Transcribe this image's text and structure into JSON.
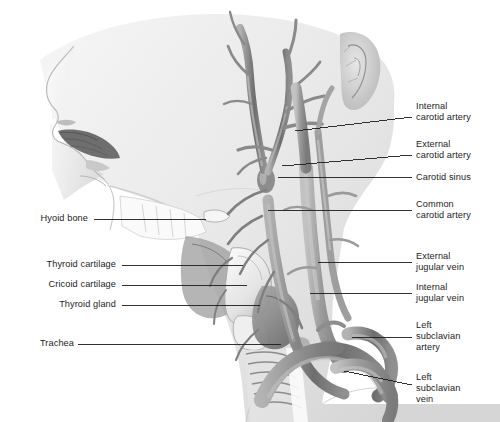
{
  "figure": {
    "background_color": "#ffffff",
    "skin_tone": "#ececec",
    "vessel_tone": "#8e8e8e",
    "outline_color": "#6f6f6f",
    "leader_color": "#1c1c1c",
    "text_color": "#1c1c1c"
  },
  "labels_right": [
    {
      "id": "internal-carotid-artery",
      "text": "Internal\ncarotid artery",
      "text_x": 416,
      "text_y": 101,
      "leader": {
        "x1": 412,
        "y1": 117,
        "x2": 295,
        "y2": 131
      }
    },
    {
      "id": "external-carotid-artery",
      "text": "External\ncarotid artery",
      "text_x": 416,
      "text_y": 139,
      "leader": {
        "x1": 412,
        "y1": 155,
        "x2": 282,
        "y2": 166
      }
    },
    {
      "id": "carotid-sinus",
      "text": "Carotid sinus",
      "text_x": 416,
      "text_y": 172,
      "leader": {
        "x1": 412,
        "y1": 177,
        "x2": 278,
        "y2": 177
      }
    },
    {
      "id": "common-carotid-artery",
      "text": "Common\ncarotid artery",
      "text_x": 416,
      "text_y": 199,
      "leader": {
        "x1": 412,
        "y1": 210,
        "x2": 268,
        "y2": 210
      }
    },
    {
      "id": "external-jugular-vein",
      "text": "External\njugular vein",
      "text_x": 416,
      "text_y": 251,
      "leader": {
        "x1": 412,
        "y1": 262,
        "x2": 318,
        "y2": 262
      }
    },
    {
      "id": "internal-jugular-vein",
      "text": "Internal\njugular vein",
      "text_x": 416,
      "text_y": 282,
      "leader": {
        "x1": 412,
        "y1": 293,
        "x2": 310,
        "y2": 293
      }
    },
    {
      "id": "left-subclavian-artery",
      "text": "Left\nsubclavian\nartery",
      "text_x": 416,
      "text_y": 320,
      "leader": {
        "x1": 412,
        "y1": 337,
        "x2": 352,
        "y2": 337
      }
    },
    {
      "id": "left-subclavian-vein",
      "text": "Left\nsubclavian\nvein",
      "text_x": 416,
      "text_y": 372,
      "leader": {
        "x1": 412,
        "y1": 385,
        "x2": 344,
        "y2": 371
      }
    }
  ],
  "labels_left": [
    {
      "id": "hyoid-bone",
      "text": "Hyoid bone",
      "text_x": 26,
      "text_y": 213,
      "text_w": 62,
      "leader": {
        "x1": 94,
        "y1": 219,
        "x2": 206,
        "y2": 219
      }
    },
    {
      "id": "thyroid-cartilage",
      "text": "Thyroid cartilage",
      "text_x": 26,
      "text_y": 259,
      "text_w": 90,
      "leader": {
        "x1": 122,
        "y1": 265,
        "x2": 243,
        "y2": 265
      }
    },
    {
      "id": "cricoid-cartilage",
      "text": "Cricoid cartilage",
      "text_x": 26,
      "text_y": 279,
      "text_w": 90,
      "leader": {
        "x1": 122,
        "y1": 285,
        "x2": 247,
        "y2": 285
      }
    },
    {
      "id": "thyroid-gland",
      "text": "Thyroid gland",
      "text_x": 26,
      "text_y": 299,
      "text_w": 90,
      "leader": {
        "x1": 122,
        "y1": 305,
        "x2": 260,
        "y2": 305
      }
    },
    {
      "id": "trachea",
      "text": "Trachea",
      "text_x": 26,
      "text_y": 338,
      "text_w": 48,
      "leader": {
        "x1": 78,
        "y1": 344,
        "x2": 281,
        "y2": 344
      }
    }
  ]
}
